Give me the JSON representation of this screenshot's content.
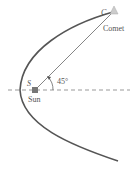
{
  "diagram": {
    "labels": {
      "sun_point": "S",
      "sun": "Sun",
      "comet_point": "C",
      "comet": "Comet",
      "angle": "45°"
    },
    "colors": {
      "orbit": "#555555",
      "sun": "#777777",
      "axis": "#888888",
      "text": "#555555"
    }
  }
}
